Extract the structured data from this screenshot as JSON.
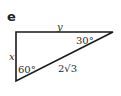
{
  "part_label": "e",
  "triangle": {
    "stroke_color": "#1a1a1a",
    "vertices": {
      "top_left": [
        16,
        32
      ],
      "top_right": [
        113,
        32
      ],
      "bottom_left": [
        16,
        81
      ]
    },
    "sides": {
      "top": "y",
      "left": "x",
      "hypotenuse": "2√3"
    },
    "angles": {
      "right_vertex": "30°",
      "bottom_vertex": "60°"
    }
  }
}
